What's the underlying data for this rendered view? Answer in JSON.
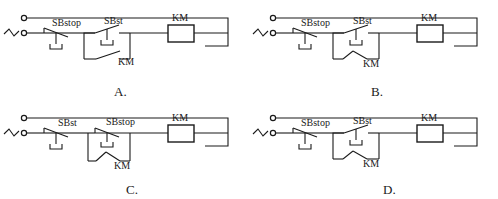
{
  "figure": {
    "title_fragment": "",
    "source_symbol": "ac-source-zigzag",
    "terminal_symbol": "circle-terminal"
  },
  "options": [
    {
      "key": "A",
      "caption": "A.",
      "position": "top-left",
      "components": [
        {
          "name": "SBstop",
          "type": "push-button-normally-closed",
          "order": 1
        },
        {
          "name": "SBst",
          "type": "push-button-normally-open",
          "order": 2
        },
        {
          "name": "KM",
          "type": "auxiliary-contact-normally-open",
          "order": 3,
          "role": "holding-contact",
          "slope": "up-right"
        },
        {
          "name": "KM",
          "type": "coil",
          "order": 4
        }
      ],
      "labels": {
        "first": "SBstop",
        "second": "SBst",
        "holding": "KM",
        "coil": "KM"
      }
    },
    {
      "key": "B",
      "caption": "B.",
      "position": "top-right",
      "components": [
        {
          "name": "SBstop",
          "type": "push-button-normally-closed",
          "order": 1
        },
        {
          "name": "SBst",
          "type": "push-button-normally-open",
          "order": 2
        },
        {
          "name": "KM",
          "type": "auxiliary-contact-normally-open",
          "order": 3,
          "role": "holding-contact",
          "slope": "up-right-mirrored"
        },
        {
          "name": "KM",
          "type": "coil",
          "order": 4
        }
      ],
      "labels": {
        "first": "SBstop",
        "second": "SBst",
        "holding": "KM",
        "coil": "KM"
      }
    },
    {
      "key": "C",
      "caption": "C.",
      "position": "bottom-left",
      "components": [
        {
          "name": "SBst",
          "type": "push-button-normally-closed",
          "order": 1
        },
        {
          "name": "SBstop",
          "type": "push-button-normally-open",
          "order": 2
        },
        {
          "name": "KM",
          "type": "auxiliary-contact-normally-open",
          "order": 3,
          "role": "holding-contact",
          "slope": "up-right-mirrored"
        },
        {
          "name": "KM",
          "type": "coil",
          "order": 4
        }
      ],
      "labels": {
        "first": "SBst",
        "second": "SBstop",
        "holding": "KM",
        "coil": "KM"
      }
    },
    {
      "key": "D",
      "caption": "D.",
      "position": "bottom-right",
      "components": [
        {
          "name": "SBstop",
          "type": "push-button-normally-closed",
          "order": 1
        },
        {
          "name": "SBst",
          "type": "push-button-normally-open",
          "order": 2
        },
        {
          "name": "KM",
          "type": "auxiliary-contact-normally-open",
          "order": 3,
          "role": "holding-contact",
          "slope": "up-right-mirrored"
        },
        {
          "name": "KM",
          "type": "coil",
          "order": 4
        }
      ],
      "labels": {
        "first": "SBstop",
        "second": "SBst",
        "holding": "KM",
        "coil": "KM"
      }
    }
  ],
  "colors": {
    "line": "#1a1a1a",
    "background": "#ffffff",
    "text": "#1a1a1a"
  }
}
